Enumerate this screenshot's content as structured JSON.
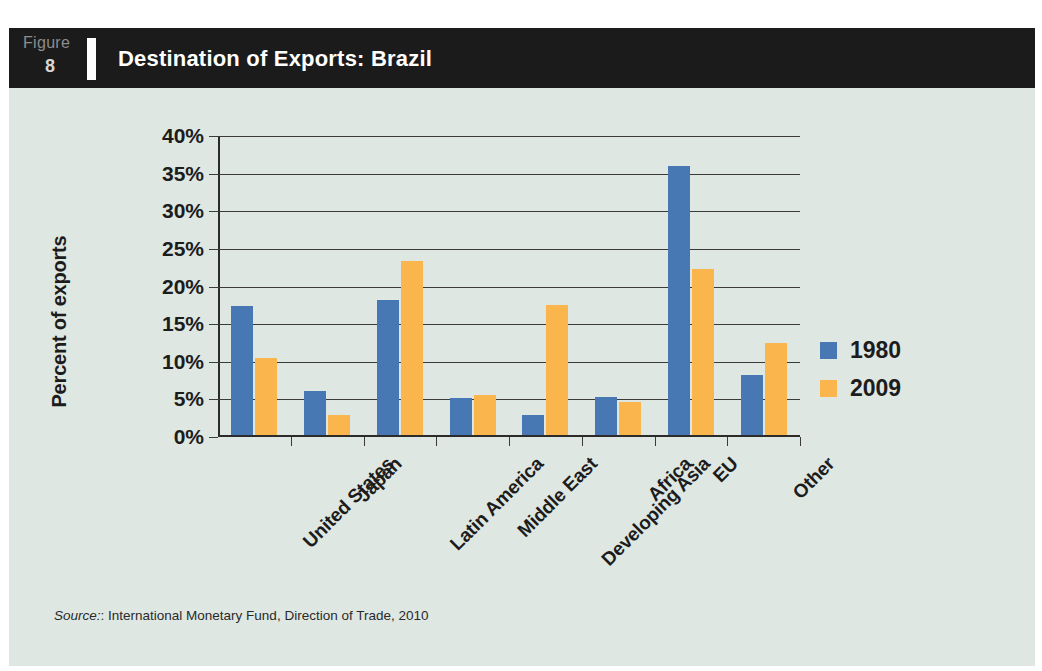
{
  "header": {
    "figure_word": "Figure",
    "figure_number": "8",
    "title": "Destination of Exports: Brazil"
  },
  "source": {
    "label": "Source:",
    "text": ": International Monetary Fund, Direction of Trade, 2010"
  },
  "chart_data": {
    "type": "bar",
    "title": "Destination of Exports: Brazil",
    "xlabel": "",
    "ylabel": "Percent of exports",
    "ylim": [
      0,
      40
    ],
    "ytick_labels": [
      "0%",
      "5%",
      "10%",
      "15%",
      "20%",
      "25%",
      "30%",
      "35%",
      "40%"
    ],
    "ytick_values": [
      0,
      5,
      10,
      15,
      20,
      25,
      30,
      35,
      40
    ],
    "grid": true,
    "legend_position": "right",
    "categories": [
      "United States",
      "Japan",
      "Latin America",
      "Middle East",
      "Developing Asia",
      "Africa",
      "EU",
      "Other"
    ],
    "series": [
      {
        "name": "1980",
        "color": "#4878b4",
        "values": [
          17.2,
          5.8,
          17.9,
          4.9,
          2.6,
          5.1,
          35.8,
          8.0
        ]
      },
      {
        "name": "2009",
        "color": "#fab54c",
        "values": [
          10.3,
          2.6,
          23.1,
          5.3,
          17.3,
          4.4,
          22.0,
          12.2
        ]
      }
    ]
  },
  "colors": {
    "series_1980": "#4878b4",
    "series_2009": "#fab54c",
    "panel_background": "#dfe7e2",
    "header_background": "#1b1b1b",
    "header_text": "#ffffff",
    "axis": "#2b2b2b"
  }
}
